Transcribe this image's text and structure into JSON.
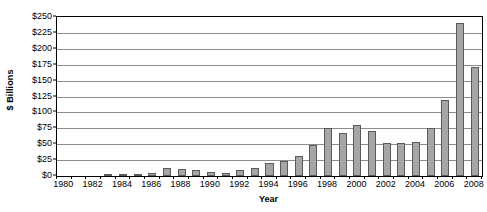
{
  "chart_data": {
    "type": "bar",
    "title": "",
    "xlabel": "Year",
    "ylabel": "$ Billions",
    "categories": [
      "1980",
      "1981",
      "1982",
      "1983",
      "1984",
      "1985",
      "1986",
      "1987",
      "1988",
      "1989",
      "1990",
      "1991",
      "1992",
      "1993",
      "1994",
      "1995",
      "1996",
      "1997",
      "1998",
      "1999",
      "2000",
      "2001",
      "2002",
      "2003",
      "2004",
      "2005",
      "2006",
      "2007",
      "2008"
    ],
    "values": [
      0,
      0,
      0,
      1,
      3,
      2,
      4,
      12,
      11,
      10,
      7,
      4,
      9,
      13,
      20,
      23,
      32,
      48,
      75,
      67,
      80,
      70,
      52,
      52,
      53,
      75,
      120,
      240,
      172
    ],
    "ylim": [
      0,
      250
    ],
    "ytick_values": [
      0,
      25,
      50,
      75,
      100,
      125,
      150,
      175,
      200,
      225,
      250
    ],
    "ytick_labels": [
      "$0",
      "$25",
      "$50",
      "$75",
      "$100",
      "$125",
      "$150",
      "$175",
      "$200",
      "$225",
      "$250"
    ],
    "xtick_labels": [
      "1980",
      "1982",
      "1984",
      "1986",
      "1988",
      "1990",
      "1992",
      "1994",
      "1996",
      "1998",
      "2000",
      "2002",
      "2004",
      "2006",
      "2008"
    ],
    "grid": true,
    "legend": false,
    "bar_color": "#a6a6a6",
    "bar_border_color": "#5a5a5a",
    "gridline_color": "#8c8c8c",
    "axis_color": "#000000"
  }
}
